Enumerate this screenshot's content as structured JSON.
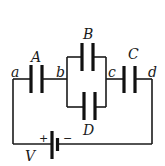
{
  "diagram": {
    "type": "circuit",
    "capacitors": [
      {
        "label": "A",
        "between": [
          "a",
          "b"
        ]
      },
      {
        "label": "B",
        "between": [
          "b",
          "c"
        ],
        "branch": "top"
      },
      {
        "label": "D",
        "between": [
          "b",
          "c"
        ],
        "branch": "bottom"
      },
      {
        "label": "C",
        "between": [
          "c",
          "d"
        ]
      }
    ],
    "nodes": [
      {
        "label": "a"
      },
      {
        "label": "b"
      },
      {
        "label": "c"
      },
      {
        "label": "d"
      }
    ],
    "battery": {
      "label": "V",
      "positive": "+",
      "negative": "−"
    }
  },
  "colors": {
    "line": "#1a1a1a",
    "background": "#ffffff"
  }
}
